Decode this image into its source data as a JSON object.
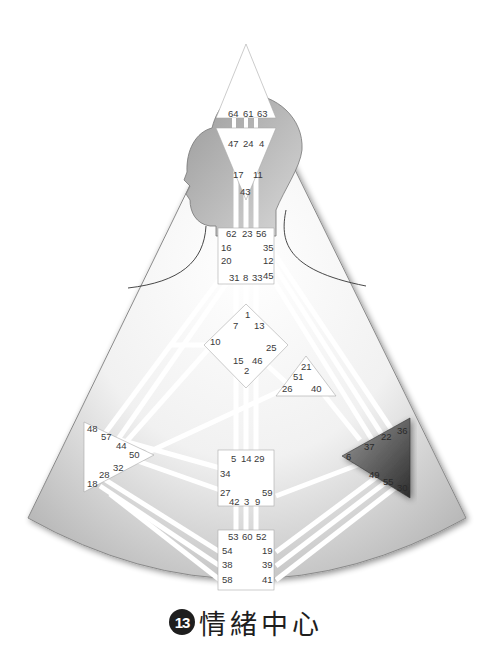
{
  "caption": {
    "number": "13",
    "title": "情緒中心"
  },
  "colors": {
    "background_shape": "#c8c8c8",
    "center_fill": "#ffffff",
    "highlighted_center": "#555555",
    "channel": "#ffffff",
    "text": "#3a3a3a"
  },
  "centers": {
    "head": {
      "name": "head-center",
      "gates": [
        "64",
        "61",
        "63"
      ]
    },
    "ajna": {
      "name": "ajna-center",
      "gates": [
        "47",
        "24",
        "4",
        "17",
        "11",
        "43"
      ]
    },
    "throat": {
      "name": "throat-center",
      "gates": [
        "62",
        "23",
        "56",
        "16",
        "35",
        "20",
        "12",
        "31",
        "8",
        "33",
        "45"
      ]
    },
    "g": {
      "name": "g-center",
      "gates": [
        "1",
        "7",
        "13",
        "10",
        "25",
        "15",
        "46",
        "2"
      ]
    },
    "heart": {
      "name": "heart-center",
      "gates": [
        "21",
        "51",
        "26",
        "40"
      ]
    },
    "spleen": {
      "name": "spleen-center",
      "gates": [
        "48",
        "57",
        "44",
        "50",
        "32",
        "28",
        "18"
      ]
    },
    "sacral": {
      "name": "sacral-center",
      "gates": [
        "5",
        "14",
        "29",
        "34",
        "27",
        "59",
        "42",
        "3",
        "9"
      ]
    },
    "root": {
      "name": "root-center",
      "gates": [
        "53",
        "60",
        "52",
        "54",
        "19",
        "38",
        "39",
        "58",
        "41"
      ]
    },
    "solar_plexus": {
      "name": "solar-plexus-center",
      "highlighted": true,
      "gates": [
        "36",
        "22",
        "37",
        "6",
        "49",
        "55",
        "30"
      ]
    }
  },
  "labels": {
    "head": [
      "64",
      "61",
      "63"
    ],
    "ajna": [
      "47",
      "24",
      "4",
      "17",
      "11",
      "43"
    ],
    "throat": [
      "62",
      "23",
      "56",
      "16",
      "35",
      "20",
      "12",
      "31",
      "8",
      "33",
      "45"
    ],
    "g": [
      "1",
      "7",
      "13",
      "10",
      "25",
      "15",
      "46",
      "2"
    ],
    "heart": [
      "21",
      "51",
      "26",
      "40"
    ],
    "spleen": [
      "48",
      "57",
      "44",
      "50",
      "32",
      "28",
      "18"
    ],
    "sacral": [
      "5",
      "14",
      "29",
      "34",
      "27",
      "59",
      "42",
      "3",
      "9"
    ],
    "root": [
      "53",
      "60",
      "52",
      "54",
      "19",
      "38",
      "39",
      "58",
      "41"
    ],
    "solar": [
      "36",
      "22",
      "37",
      "6",
      "49",
      "55",
      "30"
    ]
  }
}
